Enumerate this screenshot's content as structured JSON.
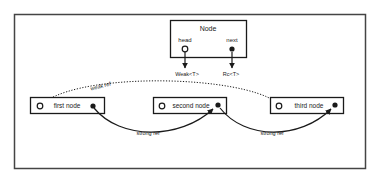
{
  "diagram": {
    "struct_node": {
      "title": "Node",
      "fields": [
        {
          "name": "head",
          "pointer": "open-circle",
          "type_label": "Weak<T>"
        },
        {
          "name": "next",
          "pointer": "filled-dot",
          "type_label": "Rc<T>"
        }
      ]
    },
    "list_nodes": [
      {
        "label": "first node"
      },
      {
        "label": "second node"
      },
      {
        "label": "third node"
      }
    ],
    "edges": [
      {
        "from": "third node",
        "to": "first node",
        "style": "dotted",
        "label": "weak ref"
      },
      {
        "from": "first node",
        "to": "second node",
        "style": "solid",
        "label": "strong ref"
      },
      {
        "from": "second node",
        "to": "third node",
        "style": "solid",
        "label": "strong ref"
      }
    ],
    "colors": {
      "stroke": "#1a1a1a",
      "frame": "#444444",
      "background": "#ffffff"
    }
  }
}
